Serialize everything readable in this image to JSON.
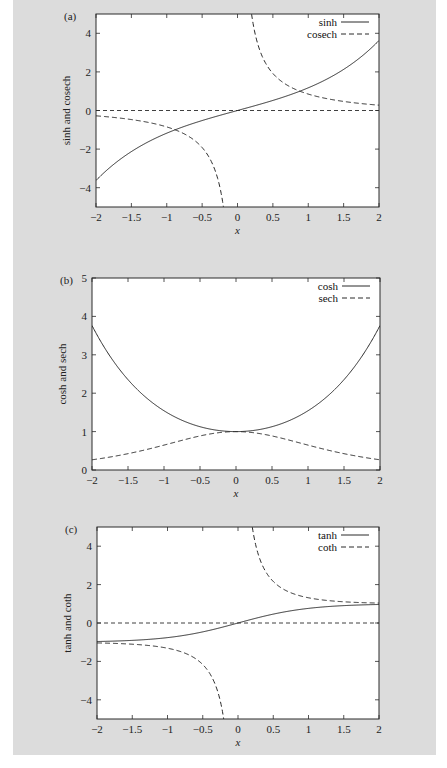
{
  "figure": {
    "background": "#dcdcdc",
    "plot_background": "#ffffff",
    "line_color": "#2a2a2a"
  },
  "chart_data": [
    {
      "panel": "(a)",
      "type": "line",
      "title": "",
      "xlabel": "x",
      "ylabel": "sinh and cosech",
      "xlim": [
        -2,
        2
      ],
      "ylim": [
        -5,
        5
      ],
      "xticks": [
        "-2",
        "-1.5",
        "-1",
        "-0.5",
        "0",
        "0.5",
        "1",
        "1.5",
        "2"
      ],
      "yticks": [
        "-4",
        "-2",
        "0",
        "2",
        "4"
      ],
      "grid": false,
      "legend_position": "upper right",
      "zero_line": true,
      "series": [
        {
          "name": "sinh",
          "style": "solid",
          "fn": "sinh",
          "x": [
            -2,
            -1.5,
            -1,
            -0.5,
            0,
            0.5,
            1,
            1.5,
            2
          ],
          "values": [
            -3.63,
            -2.13,
            -1.18,
            -0.52,
            0,
            0.52,
            1.18,
            2.13,
            3.63
          ]
        },
        {
          "name": "cosech",
          "style": "dashed",
          "fn": "cosech",
          "x": [
            -2,
            -1.5,
            -1,
            -0.5,
            -0.2,
            0.2,
            0.5,
            1,
            1.5,
            2
          ],
          "values": [
            -0.28,
            -0.47,
            -0.85,
            -1.92,
            -4.97,
            4.97,
            1.92,
            0.85,
            0.47,
            0.28
          ]
        }
      ]
    },
    {
      "panel": "(b)",
      "type": "line",
      "title": "",
      "xlabel": "x",
      "ylabel": "cosh and sech",
      "xlim": [
        -2,
        2
      ],
      "ylim": [
        0,
        5
      ],
      "xticks": [
        "-2",
        "-1.5",
        "-1",
        "-0.5",
        "0",
        "0.5",
        "1",
        "1.5",
        "2"
      ],
      "yticks": [
        "0",
        "1",
        "2",
        "3",
        "4",
        "5"
      ],
      "grid": false,
      "legend_position": "upper right",
      "zero_line": false,
      "series": [
        {
          "name": "cosh",
          "style": "solid",
          "fn": "cosh",
          "x": [
            -2,
            -1.5,
            -1,
            -0.5,
            0,
            0.5,
            1,
            1.5,
            2
          ],
          "values": [
            3.76,
            2.35,
            1.54,
            1.13,
            1.0,
            1.13,
            1.54,
            2.35,
            3.76
          ]
        },
        {
          "name": "sech",
          "style": "dashed",
          "fn": "sech",
          "x": [
            -2,
            -1.5,
            -1,
            -0.5,
            0,
            0.5,
            1,
            1.5,
            2
          ],
          "values": [
            0.27,
            0.43,
            0.65,
            0.89,
            1.0,
            0.89,
            0.65,
            0.43,
            0.27
          ]
        }
      ]
    },
    {
      "panel": "(c)",
      "type": "line",
      "title": "",
      "xlabel": "x",
      "ylabel": "tanh and coth",
      "xlim": [
        -2,
        2
      ],
      "ylim": [
        -5,
        5
      ],
      "xticks": [
        "-2",
        "-1.5",
        "-1",
        "-0.5",
        "0",
        "0.5",
        "1",
        "1.5",
        "2"
      ],
      "yticks": [
        "-4",
        "-2",
        "0",
        "2",
        "4"
      ],
      "grid": false,
      "legend_position": "upper right",
      "zero_line": true,
      "series": [
        {
          "name": "tanh",
          "style": "solid",
          "fn": "tanh",
          "x": [
            -2,
            -1.5,
            -1,
            -0.5,
            0,
            0.5,
            1,
            1.5,
            2
          ],
          "values": [
            -0.96,
            -0.91,
            -0.76,
            -0.46,
            0,
            0.46,
            0.76,
            0.91,
            0.96
          ]
        },
        {
          "name": "coth",
          "style": "dashed",
          "fn": "coth",
          "x": [
            -2,
            -1.5,
            -1,
            -0.5,
            -0.2,
            0.2,
            0.5,
            1,
            1.5,
            2
          ],
          "values": [
            -1.04,
            -1.1,
            -1.31,
            -2.16,
            -5.0,
            5.0,
            2.16,
            1.31,
            1.1,
            1.04
          ]
        }
      ]
    }
  ],
  "layout": {
    "panels": [
      {
        "left": 96,
        "top": 14,
        "right": 379,
        "bottom": 207
      },
      {
        "left": 92,
        "top": 278,
        "right": 380,
        "bottom": 470
      },
      {
        "left": 97,
        "top": 527,
        "right": 379,
        "bottom": 719
      }
    ]
  }
}
